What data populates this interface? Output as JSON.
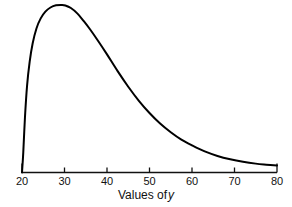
{
  "chart_data": {
    "type": "line",
    "title": "",
    "subtitle": "",
    "xlabel": "Values of y",
    "ylabel": "",
    "xlim": [
      20,
      80
    ],
    "ylim": [
      0,
      1
    ],
    "grid": false,
    "legend": null,
    "xticks": [
      20,
      30,
      40,
      50,
      60,
      70,
      80
    ],
    "xtick_labels": [
      "20",
      "30",
      "40",
      "50",
      "60",
      "70",
      "80"
    ],
    "yticks": [],
    "ytick_labels": [],
    "annotations": [],
    "series": [
      {
        "name": "density",
        "color": "#000000",
        "line_width": 2,
        "x": [
          20.0,
          20.3,
          20.7,
          21.2,
          21.8,
          22.5,
          23.4,
          24.4,
          25.5,
          26.7,
          28.0,
          29.4,
          30.2,
          31.5,
          33.0,
          34.5,
          36.0,
          38.0,
          40.0,
          42.5,
          45.0,
          47.5,
          50.0,
          52.5,
          55.0,
          57.5,
          60.0,
          63.0,
          66.0,
          69.0,
          72.0,
          75.0,
          77.5,
          80.0
        ],
        "y": [
          0.0,
          0.12,
          0.33,
          0.52,
          0.66,
          0.77,
          0.86,
          0.92,
          0.96,
          0.985,
          0.998,
          1.0,
          0.997,
          0.982,
          0.95,
          0.905,
          0.855,
          0.782,
          0.705,
          0.605,
          0.512,
          0.428,
          0.355,
          0.292,
          0.24,
          0.196,
          0.162,
          0.126,
          0.099,
          0.079,
          0.064,
          0.053,
          0.047,
          0.042
        ]
      }
    ]
  },
  "axis": {
    "line_color": "#111111",
    "tick_color": "#111111"
  },
  "xlabel_parts": {
    "prefix": "Values of",
    "variable": "y"
  }
}
